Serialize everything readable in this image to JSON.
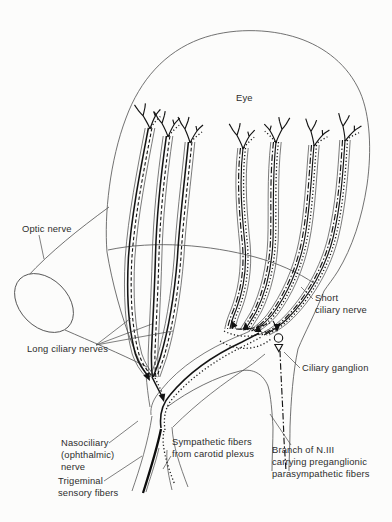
{
  "diagram": {
    "labels": {
      "eye": "Eye",
      "optic_nerve": "Optic nerve",
      "long_ciliary_nerves": "Long ciliary nerves",
      "short_ciliary_nerve": [
        "Short",
        "ciliary nerve"
      ],
      "ciliary_ganglion": "Ciliary ganglion",
      "nasociliary_nerve": [
        "Nasociliary",
        "(ophthalmic)",
        "nerve"
      ],
      "sympathetic_fibers": [
        "Sympathetic fibers",
        "from carotid plexus"
      ],
      "trigeminal_fibers": [
        "Trigeminal",
        "sensory fibers"
      ],
      "niii_branch": [
        "Branch of N.III",
        "carrying preganglionic",
        "parasympathetic fibers"
      ]
    },
    "line_legend": [
      {
        "fiber": "Trigeminal sensory fibers",
        "style": "solid"
      },
      {
        "fiber": "Sympathetic fibers from carotid plexus",
        "style": "dotted"
      },
      {
        "fiber": "Preganglionic parasympathetic fibers (branch of N.III)",
        "style": "dash-dot"
      }
    ],
    "colors": {
      "ink": "#141414",
      "outline": "#4f4f4f",
      "background": "#fcfcfb",
      "text": "#2d2d2d"
    }
  }
}
